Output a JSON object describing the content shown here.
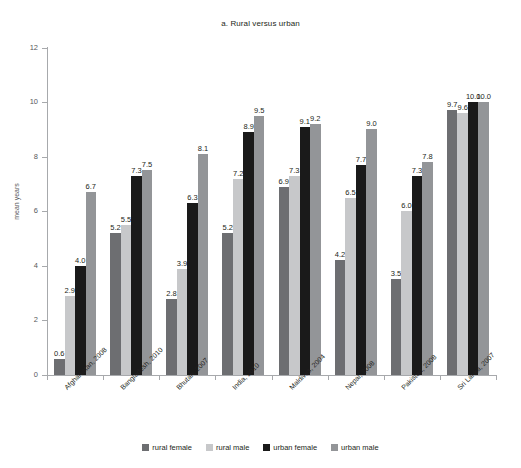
{
  "chart": {
    "title": "a. Rural versus urban",
    "ylabel": "mean years"
  },
  "chart_data": {
    "type": "bar",
    "title": "a. Rural versus urban",
    "xlabel": "",
    "ylabel": "mean years",
    "ylim": [
      0,
      12
    ],
    "yticks": [
      "0",
      "2",
      "4",
      "6",
      "8",
      "10",
      "12"
    ],
    "grid": false,
    "legend_position": "bottom",
    "categories": [
      "Afghanistan, 2008",
      "Bangladesh, 2010",
      "Bhutan, 2007",
      "India, 2010",
      "Maldives, 2004",
      "Nepal, 2008",
      "Pakistan, 2008",
      "Sri Lanka, 2007"
    ],
    "series": [
      {
        "name": "rural female",
        "color": "#6d6e71",
        "values": [
          0.6,
          5.2,
          2.8,
          5.2,
          6.9,
          4.2,
          3.5,
          9.7
        ],
        "labels": [
          "0.6",
          "5.2",
          "2.8",
          "5.2",
          "6.9",
          "4.2",
          "3.5",
          "9.7"
        ]
      },
      {
        "name": "rural male",
        "color": "#c7c8ca",
        "values": [
          2.9,
          5.5,
          3.9,
          7.2,
          7.3,
          6.5,
          6.0,
          9.6
        ],
        "labels": [
          "2.9",
          "5.5",
          "3.9",
          "7.2",
          "7.3",
          "6.5",
          "6.0",
          "9.6"
        ]
      },
      {
        "name": "urban female",
        "color": "#1a1a1a",
        "values": [
          4.0,
          7.3,
          6.3,
          8.9,
          9.1,
          7.7,
          7.3,
          10.0
        ],
        "labels": [
          "4.0",
          "7.3",
          "6.3",
          "8.9",
          "9.1",
          "7.7",
          "7.3",
          "10.0"
        ]
      },
      {
        "name": "urban male",
        "color": "#939598",
        "values": [
          6.7,
          7.5,
          8.1,
          9.5,
          9.2,
          9.0,
          7.8,
          10.0
        ],
        "labels": [
          "6.7",
          "7.5",
          "8.1",
          "9.5",
          "9.2",
          "9.0",
          "7.8",
          "10.0"
        ]
      }
    ]
  }
}
